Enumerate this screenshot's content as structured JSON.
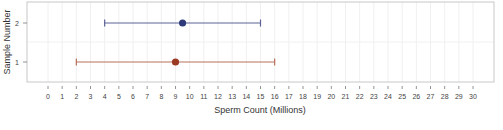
{
  "chart_data": {
    "type": "scatter",
    "subtype": "dot-with-error-bars",
    "title": "",
    "xlabel": "Sperm Count (Millions)",
    "ylabel": "Sample Number",
    "xlim": [
      0,
      30
    ],
    "x_ticks": [
      0,
      1,
      2,
      3,
      4,
      5,
      6,
      7,
      8,
      9,
      10,
      11,
      12,
      13,
      14,
      15,
      16,
      17,
      18,
      19,
      20,
      21,
      22,
      23,
      24,
      25,
      26,
      27,
      28,
      29,
      30
    ],
    "y_ticks": [
      1,
      2
    ],
    "grid": true,
    "legend": null,
    "series": [
      {
        "name": "Sample 1",
        "y": 1,
        "point": 9,
        "low": 2,
        "high": 16,
        "color": "#9b3a22",
        "line_color": "#b8705a"
      },
      {
        "name": "Sample 2",
        "y": 2,
        "point": 9.5,
        "low": 4,
        "high": 15,
        "color": "#2e3a7a",
        "line_color": "#5a6296"
      }
    ]
  }
}
